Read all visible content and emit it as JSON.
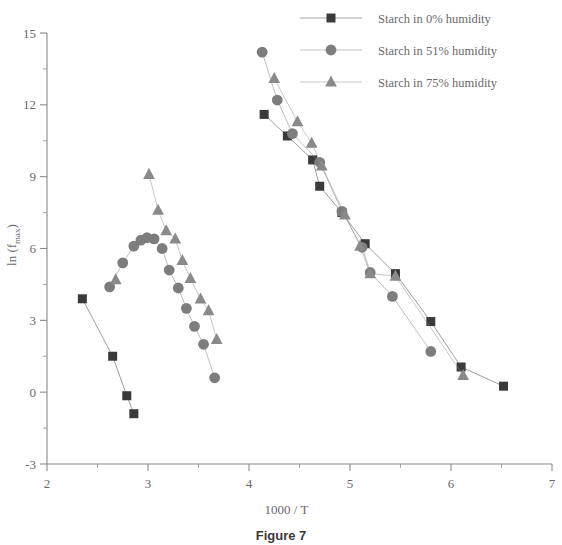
{
  "caption": "Figure 7",
  "chart_data": {
    "type": "scatter",
    "title": "",
    "subtitle": "",
    "xlabel": "1000 / T",
    "ylabel": "ln (f_max)",
    "ylabel_main": "ln (f",
    "ylabel_sub": "max",
    "ylabel_tail": ")",
    "xlim": [
      2,
      7
    ],
    "ylim": [
      -3,
      15
    ],
    "xticks": [
      2,
      3,
      4,
      5,
      6,
      7
    ],
    "yticks": [
      -3,
      0,
      3,
      6,
      9,
      12,
      15
    ],
    "xtick_labels": [
      "2",
      "3",
      "4",
      "5",
      "6",
      "7"
    ],
    "ytick_labels": [
      "-3",
      "0",
      "3",
      "6",
      "9",
      "12",
      "15"
    ],
    "xminor_step": 0.5,
    "yminor_step": 1.5,
    "grid": false,
    "legend_position": "top-right",
    "colors": {
      "series_0": "#3a3a3a",
      "series_1": "#7d7d7d",
      "series_2": "#8a8a8a",
      "axis": "#8a8a8a",
      "text": "#6a6a6a"
    },
    "series": [
      {
        "name": "Starch in 0% humidity",
        "marker": "square",
        "color": "#3a3a3a",
        "points": [
          [
            2.35,
            3.9
          ],
          [
            2.65,
            1.5
          ],
          [
            2.79,
            -0.15
          ],
          [
            2.86,
            -0.9
          ]
        ]
      },
      {
        "name": "Starch in 0% humidity",
        "marker": "square",
        "color": "#3a3a3a",
        "group": "right-branch",
        "points": [
          [
            4.15,
            11.6
          ],
          [
            4.38,
            10.7
          ],
          [
            4.63,
            9.7
          ],
          [
            4.7,
            8.6
          ],
          [
            4.92,
            7.5
          ],
          [
            5.15,
            6.2
          ],
          [
            5.45,
            4.95
          ],
          [
            5.8,
            2.95
          ],
          [
            6.1,
            1.05
          ],
          [
            6.52,
            0.25
          ]
        ]
      },
      {
        "name": "Starch in 51% humidity",
        "marker": "circle",
        "color": "#7d7d7d",
        "group": "arc",
        "points": [
          [
            2.62,
            4.4
          ],
          [
            2.75,
            5.4
          ],
          [
            2.86,
            6.1
          ],
          [
            2.93,
            6.35
          ],
          [
            2.99,
            6.45
          ],
          [
            3.06,
            6.4
          ],
          [
            3.14,
            6.0
          ],
          [
            3.21,
            5.1
          ],
          [
            3.3,
            4.35
          ],
          [
            3.38,
            3.5
          ],
          [
            3.46,
            2.75
          ],
          [
            3.55,
            2.0
          ],
          [
            3.66,
            0.6
          ]
        ]
      },
      {
        "name": "Starch in 51% humidity",
        "marker": "circle",
        "color": "#7d7d7d",
        "group": "right-branch",
        "points": [
          [
            4.13,
            14.2
          ],
          [
            4.28,
            12.2
          ],
          [
            4.43,
            10.8
          ],
          [
            4.7,
            9.6
          ],
          [
            4.92,
            7.55
          ],
          [
            5.12,
            6.05
          ],
          [
            5.2,
            5.0
          ],
          [
            5.42,
            4.0
          ],
          [
            5.8,
            1.7
          ]
        ]
      },
      {
        "name": "Starch in 75% humidity",
        "marker": "triangle",
        "color": "#8a8a8a",
        "group": "arc-left",
        "points": [
          [
            2.68,
            4.7
          ]
        ]
      },
      {
        "name": "Starch in 75% humidity",
        "marker": "triangle",
        "color": "#8a8a8a",
        "group": "descending",
        "points": [
          [
            3.01,
            9.1
          ],
          [
            3.1,
            7.6
          ],
          [
            3.18,
            6.75
          ],
          [
            3.27,
            6.4
          ],
          [
            3.34,
            5.5
          ],
          [
            3.42,
            4.75
          ],
          [
            3.52,
            3.9
          ],
          [
            3.6,
            3.4
          ],
          [
            3.68,
            2.2
          ]
        ]
      },
      {
        "name": "Starch in 75% humidity",
        "marker": "triangle",
        "color": "#8a8a8a",
        "group": "right-branch",
        "points": [
          [
            4.25,
            13.1
          ],
          [
            4.48,
            11.3
          ],
          [
            4.62,
            10.4
          ],
          [
            4.72,
            9.45
          ],
          [
            4.95,
            7.4
          ],
          [
            5.1,
            6.1
          ],
          [
            5.2,
            4.95
          ],
          [
            5.45,
            4.85
          ],
          [
            6.12,
            0.7
          ]
        ]
      }
    ]
  },
  "legend": {
    "items": [
      {
        "label": "Starch in 0% humidity",
        "marker": "square",
        "color": "#3a3a3a"
      },
      {
        "label": "Starch in 51% humidity",
        "marker": "circle",
        "color": "#7d7d7d"
      },
      {
        "label": "Starch in 75% humidity",
        "marker": "triangle",
        "color": "#8a8a8a"
      }
    ]
  }
}
